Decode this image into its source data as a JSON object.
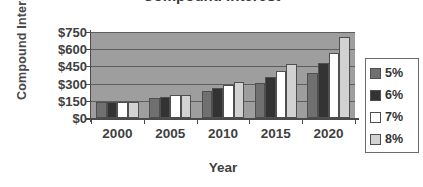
{
  "chart_data": {
    "type": "bar",
    "title": "Compound Interest",
    "xlabel": "Year",
    "ylabel": "Compound Interest",
    "categories": [
      "2000",
      "2005",
      "2010",
      "2015",
      "2020"
    ],
    "ytick_labels": [
      "$750",
      "$600",
      "$450",
      "$300",
      "$150",
      "$0"
    ],
    "ytick_values": [
      750,
      600,
      450,
      300,
      150,
      0
    ],
    "ylim": [
      0,
      750
    ],
    "grid": true,
    "legend_position": "right",
    "series": [
      {
        "name": "5%",
        "color": "#707070",
        "values": [
          140,
          175,
          235,
          305,
          395
        ]
      },
      {
        "name": "6%",
        "color": "#333333",
        "values": [
          140,
          185,
          265,
          355,
          480
        ]
      },
      {
        "name": "7%",
        "color": "#ffffff",
        "values": [
          140,
          200,
          285,
          410,
          570
        ]
      },
      {
        "name": "8%",
        "color": "#d2d2d2",
        "values": [
          140,
          205,
          315,
          475,
          710
        ]
      }
    ]
  },
  "axes": {
    "y_title": "Compound Interest",
    "x_title": "Year"
  },
  "colors": {
    "plot_background": "#9e9e9e",
    "gridline": "#5d5d5d",
    "axis": "#4a4a4a",
    "text": "#3f3f3f"
  }
}
